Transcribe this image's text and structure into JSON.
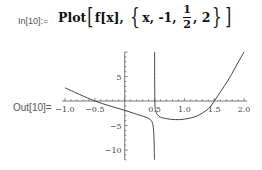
{
  "cell": {
    "in_label": "In[10]:=",
    "out_label": "Out[10]=",
    "input": {
      "head": "Plot",
      "func": "f[x]",
      "var": "x",
      "min": "-1",
      "mid_num": "1",
      "mid_den": "2",
      "max": "2"
    }
  },
  "colors": {
    "curve": "#444444",
    "axis": "#555555",
    "text": "#111111"
  },
  "chart_data": {
    "type": "line",
    "title": "",
    "xlabel": "",
    "ylabel": "",
    "xlim": [
      -1.05,
      2.05
    ],
    "ylim": [
      -12,
      10
    ],
    "grid": false,
    "x_ticks": [
      -1.0,
      -0.5,
      0.5,
      1.0,
      1.5,
      2.0
    ],
    "x_tick_labels": [
      "-1.0",
      "-0.5",
      "0.5",
      "1.0",
      "1.5",
      "2.0"
    ],
    "y_ticks": [
      5,
      -5,
      -10
    ],
    "y_tick_labels": [
      "5",
      "-5",
      "-10"
    ],
    "annotations": [
      "vertical asymptote at x = 0.5"
    ],
    "series": [
      {
        "name": "f[x] (x < 1/2)",
        "x": [
          -1.0,
          -0.75,
          -0.5,
          -0.25,
          0.0,
          0.2,
          0.35,
          0.42,
          0.46,
          0.48,
          0.49,
          0.495,
          0.499
        ],
        "y": [
          2.7,
          1.3,
          0.0,
          -1.0,
          -1.9,
          -2.7,
          -3.3,
          -3.7,
          -4.3,
          -5.5,
          -7.5,
          -9.5,
          -12.0
        ]
      },
      {
        "name": "f[x] (x > 1/2)",
        "x": [
          0.501,
          0.505,
          0.52,
          0.55,
          0.6,
          0.7,
          0.85,
          1.0,
          1.2,
          1.4,
          1.5,
          1.6,
          1.75,
          1.9,
          2.0
        ],
        "y": [
          10.0,
          0.0,
          -2.0,
          -2.8,
          -3.3,
          -3.6,
          -3.8,
          -3.7,
          -3.1,
          -1.6,
          0.0,
          1.8,
          4.6,
          7.9,
          10.0
        ]
      }
    ]
  }
}
